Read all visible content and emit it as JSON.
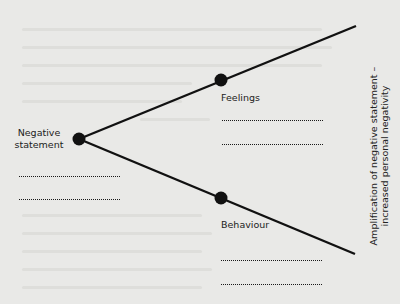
{
  "diagram": {
    "origin": {
      "label_line1": "Negative",
      "label_line2": "statement"
    },
    "branches": [
      {
        "label": "Feelings",
        "direction": "up"
      },
      {
        "label": "Behaviour",
        "direction": "down"
      }
    ],
    "axis_label": {
      "line1": "Amplification of negative statement –",
      "line2": "increased personal negativity"
    },
    "colors": {
      "background": "#e9e9e7",
      "ink": "#111111",
      "ghost_text": "#dcdcd9"
    }
  }
}
